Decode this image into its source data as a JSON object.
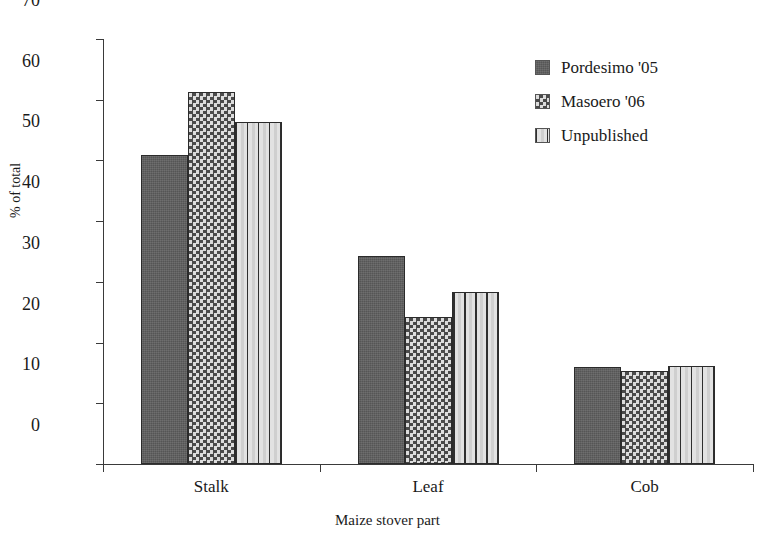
{
  "chart_data": {
    "type": "bar",
    "title": "",
    "subtitle": "",
    "xlabel": "Maize stover  part",
    "ylabel": "% of total",
    "categories": [
      "Stalk",
      "Leaf",
      "Cob"
    ],
    "series": [
      {
        "name": "Pordesimo '05",
        "pattern": "solid-gray",
        "values": [
          50.9,
          34.2,
          15.9
        ]
      },
      {
        "name": "Masoero '06",
        "pattern": "checkerboard",
        "values": [
          61.2,
          24.2,
          15.4
        ]
      },
      {
        "name": "Unpublished",
        "pattern": "vertical-stripes",
        "values": [
          56.3,
          28.3,
          16.1
        ]
      }
    ],
    "ylim": [
      0,
      70
    ],
    "ytick_labels": [
      "70",
      "60",
      "50",
      "40",
      "30",
      "20",
      "10",
      "0"
    ],
    "ytick_values": [
      70,
      60,
      50,
      40,
      30,
      20,
      10,
      0
    ],
    "grid": false,
    "legend_position": "top-right",
    "colors": {
      "solid_gray": "#5e5e5e",
      "check_dark": "#4a4a4a",
      "check_light": "#dcdcdc",
      "stripe_dark": "#2f2f2f",
      "stripe_light": "#e2e2e2",
      "axis": "#3a3a3a",
      "text": "#1a1a1a",
      "background": "#ffffff"
    }
  },
  "legend": {
    "items": [
      {
        "label": "Pordesimo '05"
      },
      {
        "label": "Masoero '06"
      },
      {
        "label": "Unpublished"
      }
    ]
  },
  "axes": {
    "y_title": "% of total",
    "x_title": "Maize stover  part"
  }
}
